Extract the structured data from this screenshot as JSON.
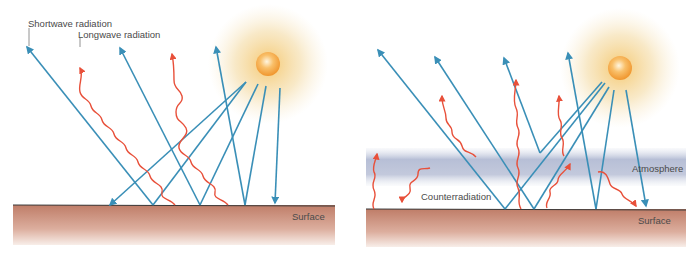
{
  "colors": {
    "shortwave": "#3a8fb7",
    "longwave": "#e8503a",
    "surface_top": "#c0806a",
    "surface_bottom": "#f3e4dc",
    "atmosphere": "#b8c0d8",
    "sun_core": "#f7a640",
    "sun_glow": "#f3d79a"
  },
  "left_panel": {
    "labels": {
      "shortwave": "Shortwave radiation",
      "longwave": "Longwave radiation",
      "surface": "Surface"
    }
  },
  "right_panel": {
    "labels": {
      "atmosphere": "Atmosphere",
      "counterradiation": "Counterradiation",
      "surface": "Surface"
    }
  }
}
